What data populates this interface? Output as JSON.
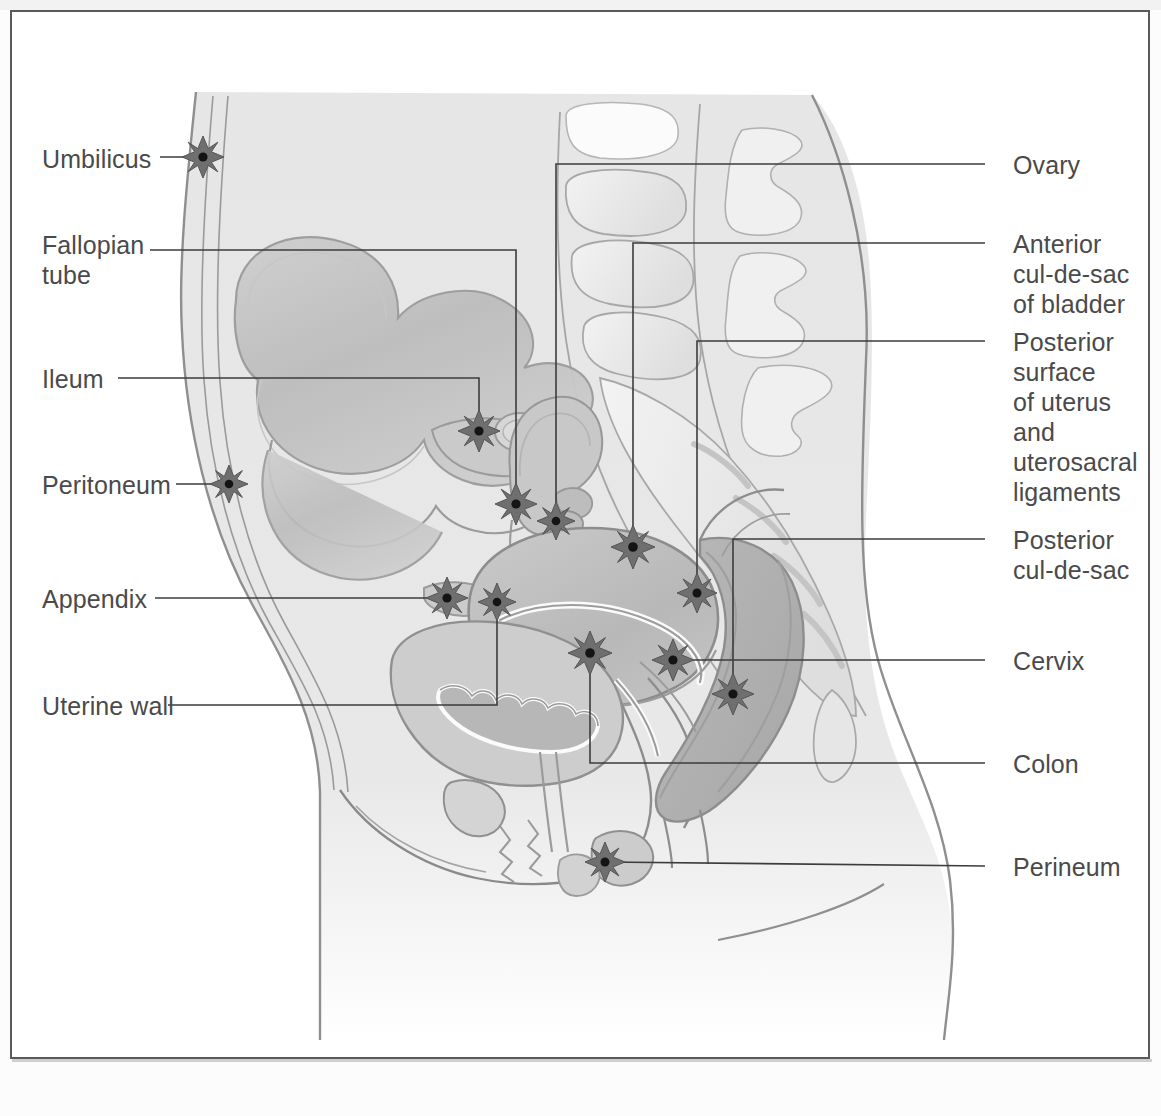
{
  "figure": {
    "frame_color": "#5a5a5a",
    "label_color": "#4a4a4a",
    "leader_color": "#3c3c3c",
    "marker": {
      "name": "endometriosis-implant-star",
      "shape": "8-point-star",
      "fill": "#6f6f6f",
      "stroke": "#4f4f4f",
      "center_dot": "#141414",
      "count": 14
    },
    "body_fill": "#e9e9e9",
    "organ_fill": "#d2d2d2",
    "organ_dark": "#b4b4b4",
    "outline": "#8a8a8a"
  },
  "labels": {
    "left": [
      {
        "id": "umbilicus",
        "text": "Umbilicus",
        "x": 42,
        "y": 148,
        "lines": 1
      },
      {
        "id": "fallopian",
        "text": "Fallopian\ntube",
        "x": 42,
        "y": 234,
        "lines": 2
      },
      {
        "id": "ileum",
        "text": "Ileum",
        "x": 42,
        "y": 361,
        "lines": 1
      },
      {
        "id": "peritoneum",
        "text": "Peritoneum",
        "x": 42,
        "y": 471,
        "lines": 1
      },
      {
        "id": "appendix",
        "text": "Appendix",
        "x": 42,
        "y": 581,
        "lines": 1
      },
      {
        "id": "uterine-wall",
        "text": "Uterine wall",
        "x": 42,
        "y": 688,
        "lines": 1
      }
    ],
    "right": [
      {
        "id": "ovary",
        "text": "Ovary",
        "x": 1013,
        "y": 146,
        "lines": 1
      },
      {
        "id": "anterior-cds",
        "text": "Anterior\ncul-de-sac\nof bladder",
        "x": 1013,
        "y": 225,
        "lines": 3
      },
      {
        "id": "posterior-uterus",
        "text": "Posterior\nsurface\nof uterus\nand\nuterosacral\nligaments",
        "x": 1013,
        "y": 323,
        "lines": 6
      },
      {
        "id": "posterior-cds",
        "text": "Posterior\ncul-de-sac",
        "x": 1013,
        "y": 527,
        "lines": 2
      },
      {
        "id": "cervix",
        "text": "Cervix",
        "x": 1013,
        "y": 645,
        "lines": 1
      },
      {
        "id": "colon",
        "text": "Colon",
        "x": 1013,
        "y": 748,
        "lines": 1
      },
      {
        "id": "perineum",
        "text": "Perineum",
        "x": 1013,
        "y": 848,
        "lines": 1
      }
    ]
  },
  "markers": [
    {
      "id": "umbilicus-marker",
      "x": 203,
      "y": 157,
      "r": 21
    },
    {
      "id": "peritoneum-marker",
      "x": 229,
      "y": 484,
      "r": 19
    },
    {
      "id": "ileum-marker",
      "x": 479,
      "y": 431,
      "r": 21
    },
    {
      "id": "fallopian-marker",
      "x": 516,
      "y": 504,
      "r": 21
    },
    {
      "id": "ovary-marker",
      "x": 556,
      "y": 521,
      "r": 19
    },
    {
      "id": "appendix-marker",
      "x": 447,
      "y": 598,
      "r": 21
    },
    {
      "id": "uterine-marker",
      "x": 497,
      "y": 602,
      "r": 19
    },
    {
      "id": "anterior-cds-marker",
      "x": 633,
      "y": 547,
      "r": 22
    },
    {
      "id": "posterior-uterus-marker",
      "x": 697,
      "y": 593,
      "r": 20
    },
    {
      "id": "posterior-cds-marker",
      "x": 590,
      "y": 653,
      "r": 22
    },
    {
      "id": "cervix-marker",
      "x": 673,
      "y": 660,
      "r": 21
    },
    {
      "id": "colon-marker",
      "x": 733,
      "y": 694,
      "r": 21
    },
    {
      "id": "perineum-marker",
      "x": 605,
      "y": 862,
      "r": 20
    }
  ],
  "leaders": [
    {
      "id": "umbilicus-leader",
      "points": "160,157 203,157"
    },
    {
      "id": "fallopian-leader",
      "points": "150,250 516,250 516,504"
    },
    {
      "id": "ileum-leader",
      "points": "118,378 479,378 479,431"
    },
    {
      "id": "peritoneum-leader",
      "points": "176,484 229,484"
    },
    {
      "id": "appendix-leader",
      "points": "155,598 447,598"
    },
    {
      "id": "uterine-leader",
      "points": "168,705 497,705 497,602"
    },
    {
      "id": "ovary-leader",
      "points": "985,164 556,164 556,521"
    },
    {
      "id": "anterior-cds-leader",
      "points": "985,243 633,243 633,547"
    },
    {
      "id": "posterior-uterus-leader",
      "points": "985,341 697,341 697,593"
    },
    {
      "id": "posterior-cds-leader",
      "points": "985,539 733,539 733,694"
    },
    {
      "id": "cervix-leader",
      "points": "985,660 673,660"
    },
    {
      "id": "colon-leader",
      "points": "985,763 590,763 590,653"
    },
    {
      "id": "perineum-leader",
      "points": "985,866 605,862"
    }
  ]
}
